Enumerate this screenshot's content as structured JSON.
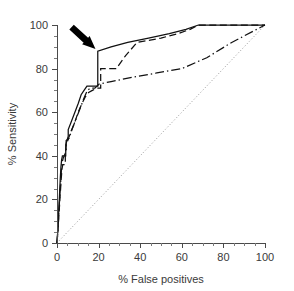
{
  "figure": {
    "background_color": "#ffffff",
    "ink_color": "#111111"
  },
  "chart_data": {
    "type": "line",
    "title": "",
    "xlabel": "% False positives",
    "ylabel": "% Sensitivity",
    "xlim": [
      0,
      100
    ],
    "ylim": [
      0,
      100
    ],
    "xticks": [
      0,
      20,
      40,
      60,
      80,
      100
    ],
    "yticks": [
      0,
      20,
      40,
      60,
      80,
      100
    ],
    "xtick_labels": [
      "0",
      "20",
      "40",
      "60",
      "80",
      "100"
    ],
    "ytick_labels": [
      "0",
      "20",
      "40",
      "60",
      "80",
      "100"
    ],
    "minor_tick_step": 5,
    "grid": false,
    "legend": "none",
    "series": [
      {
        "name": "curve-1-solid",
        "style": "solid",
        "color": "#111111",
        "points": [
          [
            0,
            0
          ],
          [
            0.4,
            6
          ],
          [
            0.7,
            12
          ],
          [
            1.0,
            18
          ],
          [
            1.3,
            24
          ],
          [
            1.6,
            30
          ],
          [
            1.9,
            35
          ],
          [
            2.2,
            38
          ],
          [
            2.6,
            40
          ],
          [
            4.2,
            40
          ],
          [
            4.2,
            45
          ],
          [
            5.4,
            49
          ],
          [
            5.4,
            52
          ],
          [
            7.0,
            56
          ],
          [
            8.6,
            60
          ],
          [
            10.2,
            64
          ],
          [
            11.6,
            68
          ],
          [
            13.0,
            70
          ],
          [
            14.4,
            72
          ],
          [
            17.5,
            72
          ],
          [
            19.6,
            72
          ],
          [
            19.6,
            88
          ],
          [
            26,
            90
          ],
          [
            34,
            92
          ],
          [
            44,
            94
          ],
          [
            54,
            96
          ],
          [
            62,
            98
          ],
          [
            68,
            100
          ],
          [
            100,
            100
          ]
        ]
      },
      {
        "name": "curve-2-dashed",
        "style": "dashed",
        "color": "#111111",
        "points": [
          [
            0,
            0
          ],
          [
            0.4,
            5
          ],
          [
            0.8,
            11
          ],
          [
            1.2,
            17
          ],
          [
            1.6,
            23
          ],
          [
            2.0,
            29
          ],
          [
            2.4,
            34
          ],
          [
            2.8,
            36
          ],
          [
            4.0,
            36
          ],
          [
            4.0,
            41
          ],
          [
            4.6,
            46
          ],
          [
            5.2,
            47
          ],
          [
            6.6,
            51
          ],
          [
            8.4,
            55
          ],
          [
            10.2,
            60
          ],
          [
            12.0,
            64
          ],
          [
            13.6,
            67
          ],
          [
            15.2,
            69
          ],
          [
            17.0,
            70
          ],
          [
            19.0,
            71
          ],
          [
            21.0,
            71
          ],
          [
            21.0,
            80
          ],
          [
            28.5,
            80
          ],
          [
            33,
            86
          ],
          [
            38.5,
            92
          ],
          [
            50,
            94
          ],
          [
            58,
            96
          ],
          [
            64,
            98
          ],
          [
            68,
            100
          ],
          [
            100,
            100
          ]
        ]
      },
      {
        "name": "curve-3-dashdot",
        "style": "dashdot",
        "color": "#111111",
        "points": [
          [
            0,
            0
          ],
          [
            0.5,
            7
          ],
          [
            0.9,
            14
          ],
          [
            1.3,
            21
          ],
          [
            1.7,
            27
          ],
          [
            2.1,
            33
          ],
          [
            2.5,
            37
          ],
          [
            3.0,
            39
          ],
          [
            4.4,
            42
          ],
          [
            4.4,
            47
          ],
          [
            5.8,
            48
          ],
          [
            7.2,
            52
          ],
          [
            8.8,
            56
          ],
          [
            10.4,
            60
          ],
          [
            12.0,
            64
          ],
          [
            13.2,
            67
          ],
          [
            14.6,
            70
          ],
          [
            16.0,
            71
          ],
          [
            18.2,
            71
          ],
          [
            20.4,
            73
          ],
          [
            26,
            74
          ],
          [
            36,
            76
          ],
          [
            48,
            78
          ],
          [
            60,
            80
          ],
          [
            72,
            85
          ],
          [
            84,
            92
          ],
          [
            100,
            100
          ]
        ]
      }
    ],
    "reference_line": {
      "name": "chance-diagonal",
      "style": "dotted",
      "color": "#8d8d8d",
      "points": [
        [
          0,
          0
        ],
        [
          100,
          100
        ]
      ]
    },
    "annotations": [
      {
        "name": "arrow-annotation",
        "kind": "arrow",
        "color": "#000000",
        "tail": [
          7,
          99
        ],
        "head": [
          18.5,
          89
        ],
        "description": "thick black arrow pointing to knee of solid curve"
      }
    ]
  }
}
